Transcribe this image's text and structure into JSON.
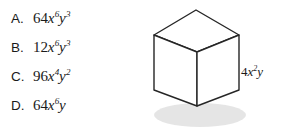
{
  "background_color": "#ffffff",
  "text_color": "#1a1a1a",
  "choices": {
    "items": [
      {
        "letter": "A.",
        "expression": "64x⁶y³",
        "coefficient": "64",
        "x_exponent": "6",
        "y_exponent": "3"
      },
      {
        "letter": "B.",
        "expression": "12x⁶y³",
        "coefficient": "12",
        "x_exponent": "6",
        "y_exponent": "3"
      },
      {
        "letter": "C.",
        "expression": "96x⁴y²",
        "coefficient": "96",
        "x_exponent": "4",
        "y_exponent": "2"
      },
      {
        "letter": "D.",
        "expression": "64x⁶y",
        "coefficient": "64",
        "x_exponent": "6",
        "y_exponent": ""
      }
    ]
  },
  "figure": {
    "shape_name": "cube",
    "edge_label": {
      "full": "4x²y",
      "coefficient": "4",
      "x_exponent": "2",
      "y_exponent": ""
    },
    "stroke_color": "#262626",
    "face_color": "#ffffff",
    "shadow_color": "#d9d9d9"
  }
}
